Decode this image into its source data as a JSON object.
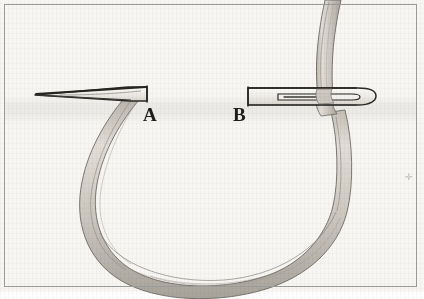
{
  "figure": {
    "domain_kind": "instructional-diagram",
    "background_color": "#f7f6f3",
    "frame_color": "#9a9a98",
    "page_color": "#ffffff"
  },
  "labels": {
    "point_a": "A",
    "point_b": "B"
  },
  "needles": {
    "left": {
      "name": "needle-point-left",
      "description": "needle shaft tapering to sharp point at left, blunt end at label A",
      "tip_x": 35,
      "end_x": 148,
      "y": 94,
      "outline_color": "#2a2926",
      "fill_color": "#f2f0ec"
    },
    "right": {
      "name": "needle-eye-right",
      "description": "needle eye end, rounded right tip with elongated eye slot, thread passing through",
      "start_x": 247,
      "end_x": 376,
      "y": 96,
      "outline_color": "#2a2926",
      "fill_color": "#f2f0ec"
    }
  },
  "thread": {
    "name": "thread-loop",
    "description": "loop of thread hanging below the fabric from A around to B, continuing upward past B off the top edge",
    "band_fill": "#c9c5bd",
    "band_fill_light": "#ded9d1",
    "strand_line": "#8d8880",
    "outline": "#6f6a63",
    "loop_bottom_y": 281,
    "left_anchor_x": 145,
    "right_anchor_x": 340,
    "exit_top_x": 330
  },
  "artifacts": {
    "speck": "✛"
  }
}
